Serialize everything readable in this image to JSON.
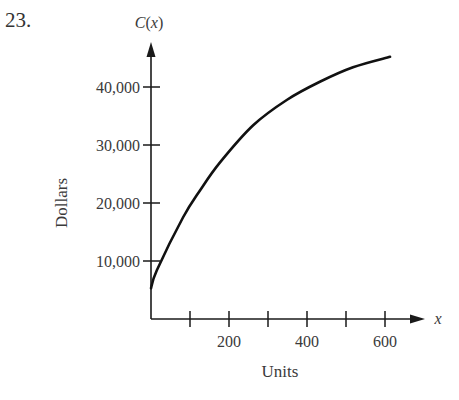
{
  "problem": {
    "number": "23."
  },
  "chart_data": {
    "type": "line",
    "title": "",
    "function_label": "C(x)",
    "xlabel": "Units",
    "ylabel": "Dollars",
    "x_axis_symbol": "x",
    "x_ticks": [
      100,
      200,
      300,
      400,
      500,
      600
    ],
    "x_tick_labels": {
      "200": "200",
      "400": "400",
      "600": "600"
    },
    "y_ticks": [
      10000,
      20000,
      30000,
      40000
    ],
    "y_tick_labels": [
      "10,000",
      "20,000",
      "30,000",
      "40,000"
    ],
    "xlim": [
      0,
      650
    ],
    "ylim": [
      0,
      50000
    ],
    "grid": false,
    "legend": null,
    "series": [
      {
        "name": "C(x)",
        "x": [
          0,
          15,
          82,
          126,
          177,
          262,
          349,
          433,
          518,
          613
        ],
        "y": [
          5300,
          8400,
          17500,
          22200,
          27000,
          33400,
          37800,
          40900,
          43400,
          45200
        ]
      }
    ],
    "colors": {
      "axis": "#1a1a1a",
      "curve": "#111111",
      "text": "#3a3a3a"
    }
  }
}
